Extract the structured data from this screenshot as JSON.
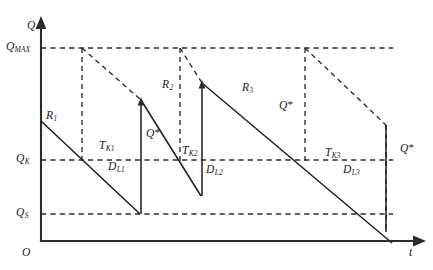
{
  "figure": {
    "type": "inventory-sawtooth-diagram",
    "background_color": "#ffffff",
    "line_color": "#1d1d1d",
    "axis_color": "#2b2b2b"
  },
  "axes": {
    "y_axis_label": "Q",
    "x_axis_label": "t",
    "origin_label": "O",
    "y_axis_x": 41,
    "x_axis_y": 241,
    "y_axis_top": 18,
    "x_axis_right": 425
  },
  "levels": [
    {
      "id": "qmax",
      "label_main": "Q",
      "label_sub": "MAX",
      "y": 48,
      "dash_x_start": 41,
      "dash_x_end": 393
    },
    {
      "id": "qk",
      "label_main": "Q",
      "label_sub": "K",
      "y": 160,
      "dash_x_start": 41,
      "dash_x_end": 393
    },
    {
      "id": "qs",
      "label_main": "Q",
      "label_sub": "S",
      "y": 214,
      "dash_x_start": 41,
      "dash_x_end": 393
    }
  ],
  "cycles": [
    {
      "id": "cycle-1",
      "replenishment_label": "R",
      "replenishment_sub": "1",
      "depletion_label": "D",
      "depletion_sub": "L1",
      "lead_time_label": "T",
      "lead_time_sub": "K1",
      "order_qty_label": "Q",
      "start_x": 41,
      "start_y": 121,
      "reorder_x": 82,
      "reorder_y": 160,
      "end_x": 140,
      "end_y": 214,
      "rise_x": 141,
      "rise_top_y": 100
    },
    {
      "id": "cycle-2",
      "replenishment_label": "R",
      "replenishment_sub": "2",
      "depletion_label": "D",
      "depletion_sub": "L2",
      "lead_time_label": "T",
      "lead_time_sub": "K2",
      "order_qty_label": "Q",
      "start_x": 141,
      "start_y": 100,
      "reorder_x": 180,
      "reorder_y": 160,
      "end_x": 201,
      "end_y": 195,
      "rise_x": 202,
      "rise_top_y": 83
    },
    {
      "id": "cycle-3",
      "replenishment_label": "R",
      "replenishment_sub": "3",
      "depletion_label": "D",
      "depletion_sub": "L3",
      "lead_time_label": "T",
      "lead_time_sub": "K3",
      "order_qty_label": "Q",
      "start_x": 202,
      "start_y": 83,
      "reorder_x": 305,
      "reorder_y": 160,
      "end_x": 386,
      "end_y": 232,
      "rise_x": 386,
      "rise_top_y": 125
    }
  ],
  "order_quantity_markers": [
    {
      "id": "qstar-1",
      "label": "Q",
      "star": "*",
      "x": 148,
      "y": 134
    },
    {
      "id": "qstar-2",
      "label": "Q",
      "star": "*",
      "x": 281,
      "y": 106
    },
    {
      "id": "qstar-3",
      "label": "Q",
      "star": "*",
      "x": 402,
      "y": 149
    }
  ],
  "curve_paths": {
    "cycle1_demand": "M 41 121 L 140 214",
    "cycle1_rise": "M 141 214 L 141 100",
    "cycle2_demand": "M 141 100 L 201 195",
    "cycle2_rise": "M 202 195 L 202 83",
    "cycle3_demand": "M 202 83 L 392 243",
    "cycle3_rise": "M 386 232 L 386 125"
  },
  "guide_paths": {
    "vertical_order_1": "M 82 48 L 82 160",
    "vertical_order_2": "M 180 48 L 180 160",
    "vertical_order_3": "M 305 48 L 305 160",
    "slope_1": "M 82 48 L 141 100",
    "slope_2": "M 180 48 L 202 83",
    "slope_3": "M 305 48 L 386 125",
    "bracket_1": "M 141 100 L 141 214",
    "bracket_2": "M 202 83 L 202 195",
    "bracket_3": "M 386 125 L 386 232"
  },
  "labels": {
    "r1": {
      "x": 48,
      "y": 116,
      "text": "R",
      "sub": "1"
    },
    "r2": {
      "x": 163,
      "y": 85,
      "text": "R",
      "sub": "2"
    },
    "r3": {
      "x": 243,
      "y": 86,
      "text": "R",
      "sub": "3"
    },
    "d_l1": {
      "x": 111,
      "y": 167,
      "text": "D",
      "sub": "L1"
    },
    "d_l2": {
      "x": 205,
      "y": 170,
      "text": "D",
      "sub": "L2"
    },
    "d_l3": {
      "x": 345,
      "y": 170,
      "text": "D",
      "sub": "L3"
    },
    "t_k1": {
      "x": 100,
      "y": 140,
      "text": "T",
      "sub": "K1"
    },
    "t_k2": {
      "x": 183,
      "y": 142,
      "text": "T",
      "sub": "K2"
    },
    "t_k3": {
      "x": 327,
      "y": 146,
      "text": "T",
      "sub": "K3"
    }
  }
}
